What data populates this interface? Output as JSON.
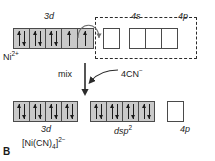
{
  "panel": {
    "label": "B"
  },
  "top": {
    "species_label": "Ni",
    "species_charge": "2+",
    "subshell_labels": {
      "d": "3d",
      "s": "4s",
      "p": "4p"
    },
    "boxes": [
      {
        "shell": "3d",
        "fill": "filled",
        "spins": [
          "up",
          "down"
        ]
      },
      {
        "shell": "3d",
        "fill": "filled",
        "spins": [
          "up",
          "down"
        ]
      },
      {
        "shell": "3d",
        "fill": "filled",
        "spins": [
          "up",
          "down"
        ]
      },
      {
        "shell": "3d",
        "fill": "filled",
        "spins": [
          "up"
        ]
      },
      {
        "shell": "3d",
        "fill": "filled",
        "spins": [
          "up"
        ]
      },
      {
        "shell": "4s",
        "fill": "empty",
        "spins": []
      },
      {
        "shell": "4p",
        "fill": "empty",
        "spins": []
      },
      {
        "shell": "4p",
        "fill": "empty",
        "spins": []
      },
      {
        "shell": "4p",
        "fill": "empty",
        "spins": []
      }
    ]
  },
  "transition": {
    "mix_label": "mix",
    "ligand_label": "4CN",
    "ligand_charge": "−"
  },
  "bottom": {
    "complex_label": "[Ni(CN)",
    "complex_sub": "4",
    "complex_close": "]",
    "complex_charge": "2−",
    "subshell_labels": {
      "d": "3d",
      "hybrid": "dsp",
      "hybrid_sup": "2",
      "p": "4p"
    },
    "boxes": [
      {
        "shell": "3d",
        "fill": "filled",
        "spins": [
          "up",
          "down"
        ]
      },
      {
        "shell": "3d",
        "fill": "filled",
        "spins": [
          "up",
          "down"
        ]
      },
      {
        "shell": "3d",
        "fill": "filled",
        "spins": [
          "up",
          "down"
        ]
      },
      {
        "shell": "3d",
        "fill": "filled",
        "spins": [
          "up",
          "down"
        ]
      },
      {
        "shell": "dsp2",
        "fill": "filled",
        "spins": [
          "up",
          "down"
        ]
      },
      {
        "shell": "dsp2",
        "fill": "filled",
        "spins": [
          "up",
          "down"
        ]
      },
      {
        "shell": "dsp2",
        "fill": "filled",
        "spins": [
          "up",
          "down"
        ]
      },
      {
        "shell": "dsp2",
        "fill": "filled",
        "spins": [
          "up",
          "down"
        ]
      },
      {
        "shell": "4p",
        "fill": "empty",
        "spins": []
      }
    ]
  },
  "colors": {
    "box_fill": "#c9c9c9",
    "box_empty": "#ffffff",
    "stroke": "#4a4a4a",
    "ink": "#1a1a1a"
  }
}
